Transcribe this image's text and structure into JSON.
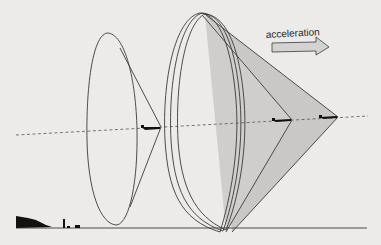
{
  "diagram": {
    "annotation": {
      "arrow_label": "acceleration",
      "arrow_direction": "right"
    },
    "colors": {
      "background": "#ecebe9",
      "line": "#3a3a3a",
      "cone_fill": "#c9c8c6",
      "arrow_fill": "#d4d3d1",
      "ground_silhouette": "#111111"
    },
    "elements": [
      "stationary-cone-small",
      "accelerating-cone-large-1",
      "accelerating-cone-large-2",
      "line-of-flight-dashed",
      "ground-line",
      "aircraft-1",
      "aircraft-2",
      "aircraft-3",
      "ground-silhouette"
    ]
  }
}
